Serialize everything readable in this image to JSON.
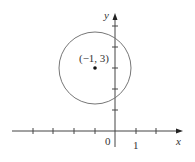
{
  "figure": {
    "type": "coordinate-plane-circle",
    "axes": {
      "x_label": "x",
      "y_label": "y",
      "origin_label": "0",
      "x_tick_label": "1",
      "x_ticks": [
        -4,
        -3,
        -2,
        -1,
        1,
        2
      ],
      "y_ticks": [
        1,
        2,
        3,
        4,
        5
      ]
    },
    "circle": {
      "center_label": "(−1, 3)",
      "center": [
        -1,
        3
      ],
      "radius_units": 1.75
    },
    "colors": {
      "axis": "#444444",
      "circle": "#777777",
      "text": "#333333"
    }
  }
}
